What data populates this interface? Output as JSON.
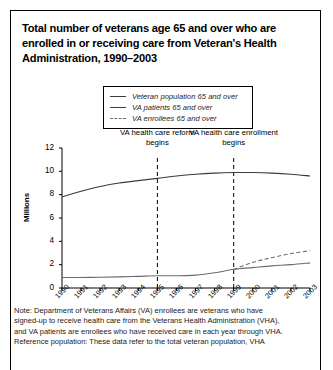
{
  "title": "Total number of veterans age 65 and over who are enrolled in or receiving care from Veteran's Health Administration, 1990–2003",
  "legend": {
    "items": [
      {
        "label": "Veteran population 65 and over",
        "style": "solid",
        "color": "#3b3b3b"
      },
      {
        "label": "VA patients 65 and over",
        "style": "solid",
        "color": "#6b6b6b"
      },
      {
        "label": "VA enrollees 65 and over",
        "style": "dashed",
        "color": "#6b6b6b"
      }
    ]
  },
  "annotations": [
    {
      "text": "VA health care reform begins",
      "year": 1995
    },
    {
      "text": "VA health care enrollment begins",
      "year": 1999
    }
  ],
  "note": [
    "Note: Department of Veterans Affairs (VA) enrollees are veterans who have",
    "signed-up to receive health care from the Veterans Health Administration (VHA),",
    "and VA patients are enrollees who have received care in each year through VHA.",
    "Reference population: These data refer to the total veteran population, VHA"
  ],
  "chart_data": {
    "type": "line",
    "title": "Total number of veterans age 65 and over who are enrolled in or receiving care from Veteran's Health Administration, 1990–2003",
    "xlabel": "",
    "ylabel": "Millions",
    "x": [
      1990,
      1991,
      1992,
      1993,
      1994,
      1995,
      1996,
      1997,
      1998,
      1999,
      2000,
      2001,
      2002,
      2003
    ],
    "xlim": [
      1990,
      2003
    ],
    "ylim": [
      0,
      12
    ],
    "yticks": [
      0,
      2,
      4,
      6,
      8,
      10,
      12
    ],
    "ytick_labels": [
      "0",
      "2",
      "4",
      "6",
      "8",
      "10",
      "12"
    ],
    "xtick_labels": [
      "1990",
      "1991",
      "1992",
      "1993",
      "1994",
      "1995",
      "1996",
      "1997",
      "1998",
      "1999",
      "2000",
      "2001",
      "2002",
      "2003"
    ],
    "grid": false,
    "legend_position": "top-center",
    "series": [
      {
        "name": "Veteran population 65 and over",
        "style": "solid",
        "color": "#3b3b3b",
        "values": [
          7.8,
          8.3,
          8.7,
          9.0,
          9.2,
          9.4,
          9.6,
          9.75,
          9.85,
          9.9,
          9.9,
          9.85,
          9.75,
          9.6
        ]
      },
      {
        "name": "VA patients 65 and over",
        "style": "solid",
        "color": "#6b6b6b",
        "values": [
          0.9,
          0.9,
          0.92,
          0.95,
          1.0,
          1.05,
          1.05,
          1.1,
          1.3,
          1.6,
          1.75,
          1.9,
          2.0,
          2.15
        ]
      },
      {
        "name": "VA enrollees 65 and over",
        "style": "dashed",
        "color": "#6b6b6b",
        "values": [
          null,
          null,
          null,
          null,
          null,
          null,
          null,
          null,
          null,
          1.6,
          2.2,
          2.6,
          2.95,
          3.2
        ]
      }
    ],
    "vlines": [
      {
        "x": 1995,
        "label": "VA health care reform begins",
        "style": "dashed"
      },
      {
        "x": 1999,
        "label": "VA health care enrollment begins",
        "style": "dashed"
      }
    ]
  }
}
